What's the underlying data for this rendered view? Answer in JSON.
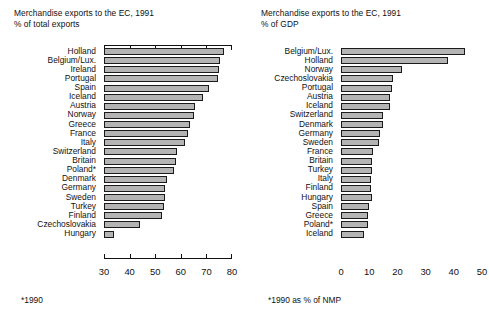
{
  "charts": [
    {
      "id": "left",
      "title_line1": "Merchandise exports to the EC, 1991",
      "title_line2": "% of total exports",
      "footnote": "*1990",
      "axis": {
        "min": 30,
        "max": 80,
        "ticks": [
          30,
          40,
          50,
          60,
          70,
          80
        ]
      }
    },
    {
      "id": "right",
      "title_line1": "Merchandise exports to the EC, 1991",
      "title_line2": "% of GDP",
      "footnote": "*1990 as % of NMP",
      "axis": {
        "min": 0,
        "max": 50,
        "ticks": [
          0,
          10,
          20,
          30,
          40,
          50
        ]
      }
    }
  ],
  "chart_data": [
    {
      "type": "bar",
      "orientation": "horizontal",
      "title": "Merchandise exports to the EC, 1991",
      "subtitle": "% of total exports",
      "xlabel": "% of total exports",
      "ylabel": "",
      "xlim": [
        30,
        80
      ],
      "xticks": [
        30,
        40,
        50,
        60,
        70,
        80
      ],
      "grid": false,
      "legend": "none",
      "footnote": "*1990",
      "categories": [
        "Holland",
        "Belgium/Lux.",
        "Ireland",
        "Portugal",
        "Spain",
        "Iceland",
        "Austria",
        "Norway",
        "Greece",
        "France",
        "Italy",
        "Switzerland",
        "Britain",
        "Poland*",
        "Denmark",
        "Germany",
        "Sweden",
        "Turkey",
        "Finland",
        "Czechoslovakia",
        "Hungary"
      ],
      "values": [
        77,
        75.5,
        75,
        74.5,
        71,
        68.5,
        65.5,
        65,
        63.5,
        63,
        61.5,
        58.5,
        58,
        57.5,
        54.5,
        54,
        54,
        53.5,
        52.5,
        44,
        34
      ]
    },
    {
      "type": "bar",
      "orientation": "horizontal",
      "title": "Merchandise exports to the EC, 1991",
      "subtitle": "% of GDP",
      "xlabel": "% of GDP",
      "ylabel": "",
      "xlim": [
        0,
        50
      ],
      "xticks": [
        0,
        10,
        20,
        30,
        40,
        50
      ],
      "grid": false,
      "legend": "none",
      "footnote": "*1990 as % of NMP",
      "categories": [
        "Belgium/Lux.",
        "Holland",
        "Norway",
        "Czechoslovakia",
        "Portugal",
        "Austria",
        "Iceland",
        "Switzerland",
        "Denmark",
        "Germany",
        "Sweden",
        "France",
        "Britain",
        "Turkey",
        "Italy",
        "Finland",
        "Hungary",
        "Spain",
        "Greece",
        "Poland*",
        "Iceland"
      ],
      "values": [
        44,
        38,
        21.5,
        18.5,
        18,
        17.5,
        17.5,
        15,
        15,
        14,
        13.5,
        11.5,
        11,
        11,
        10.5,
        10.5,
        11,
        10,
        9.5,
        9.5,
        8
      ]
    }
  ]
}
